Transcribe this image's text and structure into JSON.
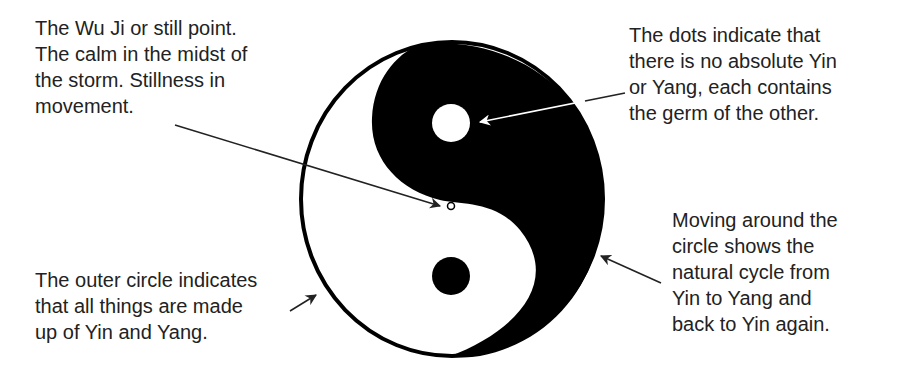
{
  "diagram": {
    "annotations": [
      {
        "id": "wu-ji",
        "lines": [
          "The Wu Ji or still point.",
          "The calm in the midst of",
          "the storm. Stillness in",
          "movement."
        ],
        "points_to": "center still point"
      },
      {
        "id": "dots",
        "lines": [
          "The dots indicate that",
          "there is no absolute Yin",
          "or Yang, each contains",
          "the germ of the other."
        ],
        "points_to": "white dot in black half"
      },
      {
        "id": "outer-circle",
        "lines": [
          "The outer circle indicates",
          "that all things are made",
          "up of Yin and Yang."
        ],
        "points_to": "outer circle"
      },
      {
        "id": "cycle",
        "lines": [
          "Moving around the",
          "circle shows the",
          "natural cycle from",
          "Yin to Yang and",
          "back to Yin again."
        ],
        "points_to": "right edge of circle"
      }
    ],
    "colors": {
      "yin": "#000000",
      "yang": "#ffffff",
      "text": "#222222",
      "arrow": "#222222"
    }
  }
}
